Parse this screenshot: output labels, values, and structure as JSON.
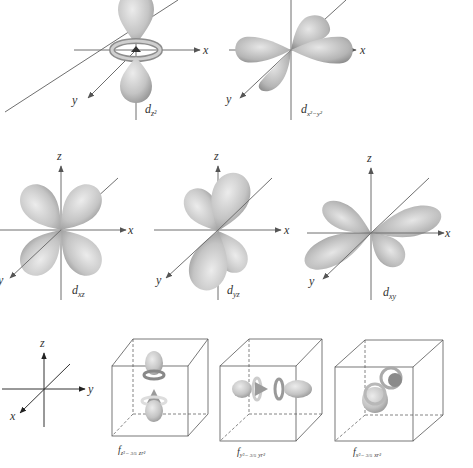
{
  "figure": {
    "colors": {
      "lobe_light": "#e4e4e4",
      "lobe_dark": "#9a9a9a",
      "axis": "#6f6f6f",
      "text": "#333333"
    }
  },
  "orbitals": [
    {
      "id": "dz2",
      "symbol": "d",
      "subscript": "z²",
      "axes": {
        "x": "x",
        "y": "y"
      }
    },
    {
      "id": "dx2y2",
      "symbol": "d",
      "subscript": "x²−y²",
      "axes": {
        "x": "x",
        "y": "y"
      }
    },
    {
      "id": "dxz",
      "symbol": "d",
      "subscript": "xz",
      "axes": {
        "x": "x",
        "y": "y",
        "z": "z"
      }
    },
    {
      "id": "dyz",
      "symbol": "d",
      "subscript": "yz",
      "axes": {
        "x": "x",
        "y": "y",
        "z": "z"
      }
    },
    {
      "id": "dxy",
      "symbol": "d",
      "subscript": "xy",
      "axes": {
        "x": "x",
        "y": "y",
        "z": "z"
      }
    }
  ],
  "f_orbitals": {
    "reference_axes": {
      "x": "x",
      "y": "y",
      "z": "z"
    },
    "items": [
      {
        "id": "fz3",
        "symbol": "f",
        "subscript": "z³− ",
        "fraction": "3/5",
        "tail": "zr²"
      },
      {
        "id": "fy3",
        "symbol": "f",
        "subscript": "y³− ",
        "fraction": "3/5",
        "tail": "yr²"
      },
      {
        "id": "fx3",
        "symbol": "f",
        "subscript": "x³− ",
        "fraction": "3/5",
        "tail": "xr²"
      }
    ]
  }
}
